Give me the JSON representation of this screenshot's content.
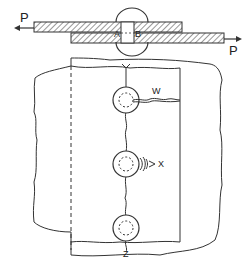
{
  "diagram": {
    "side_view": {
      "load_left_label": "P",
      "load_right_label": "P",
      "shear_plane_left_label": "A",
      "shear_plane_right_label": "B"
    },
    "plan_view": {
      "label_w": "W",
      "label_x": "X",
      "label_y": "Y",
      "label_z": "Z"
    },
    "colors": {
      "line": "#333333",
      "background": "#ffffff"
    }
  }
}
